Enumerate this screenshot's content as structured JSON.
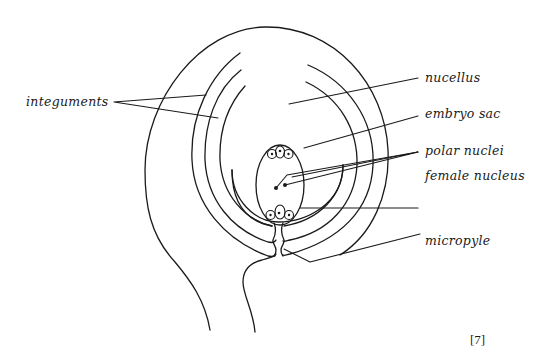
{
  "diagram": {
    "labels": {
      "integuments": "integuments",
      "nucellus": "nucellus",
      "embryo_sac": "embryo sac",
      "polar_nuclei": "polar nuclei",
      "female_nucleus": "female nucleus",
      "micropyle": "micropyle"
    },
    "marks": "[7]"
  }
}
